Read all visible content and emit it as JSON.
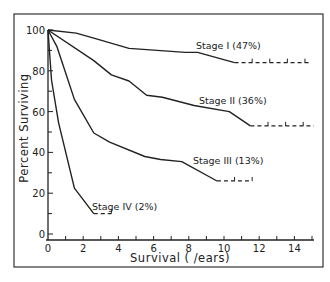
{
  "chart_data": {
    "type": "line",
    "title": "",
    "xlabel": "Survival ( /ears)",
    "ylabel": "Percent Surviving",
    "xlim": [
      0,
      15
    ],
    "ylim": [
      0,
      100
    ],
    "x_ticks": [
      0,
      2,
      4,
      6,
      8,
      10,
      12,
      14
    ],
    "x_tick_labels": [
      "0",
      "2",
      "4",
      "6",
      "8",
      "10",
      "12",
      "14"
    ],
    "y_ticks": [
      0,
      20,
      40,
      60,
      80,
      100
    ],
    "y_tick_labels": [
      "0",
      "20",
      "40",
      "60",
      "80",
      "100"
    ],
    "grid": false,
    "legend": "inline labels",
    "series": [
      {
        "name": "Stage I (47%)",
        "points": [
          [
            0,
            100
          ],
          [
            1.6,
            98.5
          ],
          [
            2.6,
            96
          ],
          [
            4.6,
            91
          ],
          [
            7.8,
            89
          ],
          [
            8.5,
            89
          ],
          [
            10.6,
            84
          ]
        ],
        "censored_to": 14.9
      },
      {
        "name": "Stage II (36%)",
        "points": [
          [
            0,
            100
          ],
          [
            2.6,
            85
          ],
          [
            3.6,
            78
          ],
          [
            4.6,
            75
          ],
          [
            5.6,
            68
          ],
          [
            6.5,
            67
          ],
          [
            8.3,
            63
          ],
          [
            10.3,
            60
          ],
          [
            11.5,
            53
          ]
        ],
        "censored_to": 15.1
      },
      {
        "name": "Stage III (13%)",
        "points": [
          [
            0,
            100
          ],
          [
            0.5,
            92
          ],
          [
            1.5,
            66
          ],
          [
            2.6,
            49.5
          ],
          [
            3.5,
            45
          ],
          [
            5.5,
            38
          ],
          [
            6.4,
            36.5
          ],
          [
            7.6,
            35.5
          ],
          [
            9.6,
            26
          ]
        ],
        "censored_to": 11.6
      },
      {
        "name": "Stage IV (2%)",
        "points": [
          [
            0,
            100
          ],
          [
            0.2,
            75.5
          ],
          [
            0.6,
            54.5
          ],
          [
            1.5,
            22.5
          ],
          [
            2.6,
            10
          ]
        ],
        "censored_to": 3.6
      }
    ],
    "annotations": [
      {
        "text": "Stage I (47%)",
        "series": 0
      },
      {
        "text": "Stage II (36%)",
        "series": 1
      },
      {
        "text": "Stage III (13%)",
        "series": 2
      },
      {
        "text": "Stage IV (2%)",
        "series": 3
      }
    ]
  }
}
